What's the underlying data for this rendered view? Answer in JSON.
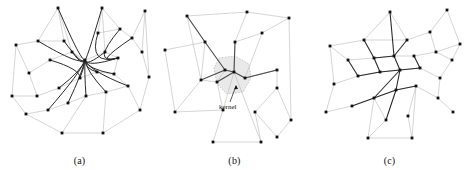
{
  "figure": {
    "background_color": "#ffffff",
    "panel_count": 3,
    "node_color": "#111111",
    "light_edge_color": "#b9b9b9",
    "dark_edge_color": "#2b2b2b",
    "kernel_fill_color": "#e9e9e9",
    "kernel_stroke_color": "#a8a8a8"
  },
  "panels": [
    {
      "id": "a",
      "caption": "(a)",
      "description": "bundled-curved-edge-drawing"
    },
    {
      "id": "b",
      "caption": "(b)",
      "description": "mesh-with-kernel-region",
      "annotation": {
        "label": "kernel",
        "arrow": true
      }
    },
    {
      "id": "c",
      "caption": "(c)",
      "description": "bundled-straight-edge-drawing"
    }
  ],
  "chart_data": {
    "type": "scatter",
    "title": "",
    "xlabel": "",
    "ylabel": "",
    "layout": "three side-by-side graph drawings",
    "panel_a": {
      "caption": "(a)",
      "nodes": [
        [
          14,
          45
        ],
        [
          56,
          8
        ],
        [
          100,
          8
        ],
        [
          143,
          11
        ],
        [
          36,
          41
        ],
        [
          62,
          41
        ],
        [
          96,
          33
        ],
        [
          118,
          29
        ],
        [
          130,
          38
        ],
        [
          27,
          73
        ],
        [
          48,
          60
        ],
        [
          70,
          52
        ],
        [
          83,
          60
        ],
        [
          103,
          52
        ],
        [
          116,
          58
        ],
        [
          10,
          96
        ],
        [
          35,
          96
        ],
        [
          57,
          88
        ],
        [
          78,
          78
        ],
        [
          95,
          72
        ],
        [
          112,
          74
        ],
        [
          24,
          114
        ],
        [
          46,
          110
        ],
        [
          66,
          103
        ],
        [
          84,
          96
        ],
        [
          104,
          92
        ],
        [
          126,
          86
        ],
        [
          60,
          133
        ],
        [
          101,
          133
        ],
        [
          138,
          110
        ],
        [
          147,
          77
        ],
        [
          140,
          52
        ]
      ],
      "light_edges": [
        [
          0,
          4
        ],
        [
          0,
          9
        ],
        [
          0,
          15
        ],
        [
          1,
          4
        ],
        [
          1,
          5
        ],
        [
          1,
          11
        ],
        [
          2,
          6
        ],
        [
          2,
          7
        ],
        [
          2,
          13
        ],
        [
          3,
          8
        ],
        [
          3,
          31
        ],
        [
          3,
          30
        ],
        [
          4,
          5
        ],
        [
          5,
          11
        ],
        [
          6,
          7
        ],
        [
          7,
          8
        ],
        [
          8,
          31
        ],
        [
          9,
          10
        ],
        [
          9,
          16
        ],
        [
          10,
          11
        ],
        [
          11,
          12
        ],
        [
          12,
          13
        ],
        [
          13,
          14
        ],
        [
          14,
          20
        ],
        [
          15,
          16
        ],
        [
          16,
          17
        ],
        [
          17,
          18
        ],
        [
          18,
          19
        ],
        [
          19,
          20
        ],
        [
          20,
          26
        ],
        [
          21,
          22
        ],
        [
          22,
          23
        ],
        [
          23,
          24
        ],
        [
          24,
          25
        ],
        [
          25,
          26
        ],
        [
          26,
          29
        ],
        [
          27,
          28
        ],
        [
          27,
          21
        ],
        [
          28,
          29
        ],
        [
          29,
          30
        ],
        [
          30,
          31
        ],
        [
          15,
          21
        ],
        [
          27,
          24
        ],
        [
          28,
          25
        ]
      ],
      "dark_edges_curved": [
        [
          1,
          12
        ],
        [
          2,
          12
        ],
        [
          4,
          12
        ],
        [
          5,
          12
        ],
        [
          11,
          12
        ],
        [
          10,
          18
        ],
        [
          18,
          12
        ],
        [
          19,
          12
        ],
        [
          13,
          12
        ],
        [
          20,
          12
        ],
        [
          24,
          12
        ],
        [
          23,
          12
        ],
        [
          17,
          12
        ],
        [
          22,
          12
        ],
        [
          25,
          12
        ],
        [
          26,
          12
        ],
        [
          6,
          14
        ],
        [
          7,
          14
        ],
        [
          8,
          14
        ],
        [
          14,
          12
        ]
      ]
    },
    "panel_b": {
      "caption": "(b)",
      "annotation_label": "kernel",
      "nodes": [
        [
          30,
          16
        ],
        [
          90,
          12
        ],
        [
          132,
          18
        ],
        [
          8,
          50
        ],
        [
          48,
          42
        ],
        [
          105,
          33
        ],
        [
          78,
          42
        ],
        [
          77,
          72
        ],
        [
          68,
          70
        ],
        [
          60,
          82
        ],
        [
          120,
          70
        ],
        [
          120,
          88
        ],
        [
          44,
          80
        ],
        [
          18,
          112
        ],
        [
          66,
          110
        ],
        [
          98,
          112
        ],
        [
          134,
          120
        ],
        [
          120,
          137
        ],
        [
          56,
          142
        ],
        [
          104,
          142
        ],
        [
          88,
          78
        ]
      ],
      "light_edges": [
        [
          0,
          1
        ],
        [
          1,
          2
        ],
        [
          0,
          4
        ],
        [
          1,
          6
        ],
        [
          2,
          5
        ],
        [
          5,
          6
        ],
        [
          3,
          4
        ],
        [
          3,
          13
        ],
        [
          4,
          12
        ],
        [
          12,
          13
        ],
        [
          13,
          14
        ],
        [
          14,
          18
        ],
        [
          18,
          19
        ],
        [
          19,
          15
        ],
        [
          15,
          17
        ],
        [
          17,
          16
        ],
        [
          16,
          11
        ],
        [
          11,
          10
        ],
        [
          10,
          20
        ],
        [
          9,
          14
        ],
        [
          8,
          9
        ],
        [
          12,
          9
        ],
        [
          6,
          7
        ],
        [
          7,
          20
        ],
        [
          20,
          10
        ],
        [
          7,
          8
        ],
        [
          0,
          12
        ],
        [
          2,
          16
        ],
        [
          5,
          20
        ],
        [
          15,
          11
        ],
        [
          14,
          7
        ],
        [
          19,
          7
        ]
      ],
      "dark_edges": [
        [
          4,
          8
        ],
        [
          12,
          8
        ],
        [
          8,
          7
        ],
        [
          7,
          20
        ],
        [
          20,
          10
        ],
        [
          7,
          9
        ],
        [
          6,
          7
        ],
        [
          0,
          4
        ]
      ],
      "kernel_region": [
        [
          62,
          58
        ],
        [
          78,
          56
        ],
        [
          92,
          64
        ],
        [
          94,
          78
        ],
        [
          86,
          92
        ],
        [
          70,
          94
        ],
        [
          60,
          84
        ],
        [
          57,
          68
        ]
      ]
    },
    "panel_c": {
      "caption": "(c)",
      "nodes": [
        [
          18,
          46
        ],
        [
          78,
          12
        ],
        [
          135,
          10
        ],
        [
          148,
          44
        ],
        [
          52,
          40
        ],
        [
          95,
          40
        ],
        [
          118,
          32
        ],
        [
          36,
          60
        ],
        [
          62,
          58
        ],
        [
          82,
          56
        ],
        [
          102,
          56
        ],
        [
          124,
          52
        ],
        [
          140,
          60
        ],
        [
          22,
          84
        ],
        [
          46,
          76
        ],
        [
          68,
          72
        ],
        [
          88,
          70
        ],
        [
          108,
          68
        ],
        [
          128,
          78
        ],
        [
          14,
          112
        ],
        [
          40,
          106
        ],
        [
          62,
          98
        ],
        [
          84,
          90
        ],
        [
          104,
          86
        ],
        [
          126,
          98
        ],
        [
          141,
          112
        ],
        [
          56,
          138
        ],
        [
          100,
          138
        ],
        [
          74,
          120
        ],
        [
          96,
          116
        ]
      ],
      "light_edges": [
        [
          0,
          4
        ],
        [
          0,
          7
        ],
        [
          0,
          13
        ],
        [
          1,
          4
        ],
        [
          1,
          5
        ],
        [
          2,
          6
        ],
        [
          2,
          3
        ],
        [
          3,
          12
        ],
        [
          3,
          11
        ],
        [
          4,
          5
        ],
        [
          5,
          6
        ],
        [
          6,
          11
        ],
        [
          7,
          8
        ],
        [
          8,
          9
        ],
        [
          9,
          10
        ],
        [
          10,
          11
        ],
        [
          11,
          12
        ],
        [
          13,
          14
        ],
        [
          14,
          15
        ],
        [
          15,
          16
        ],
        [
          16,
          17
        ],
        [
          17,
          18
        ],
        [
          18,
          24
        ],
        [
          18,
          12
        ],
        [
          19,
          20
        ],
        [
          20,
          21
        ],
        [
          21,
          22
        ],
        [
          22,
          23
        ],
        [
          23,
          24
        ],
        [
          24,
          25
        ],
        [
          26,
          27
        ],
        [
          26,
          21
        ],
        [
          27,
          23
        ],
        [
          13,
          19
        ],
        [
          28,
          21
        ],
        [
          29,
          23
        ],
        [
          26,
          28
        ],
        [
          27,
          29
        ]
      ],
      "dark_edges": [
        [
          4,
          8
        ],
        [
          8,
          9
        ],
        [
          9,
          16
        ],
        [
          14,
          15
        ],
        [
          15,
          16
        ],
        [
          16,
          22
        ],
        [
          16,
          17
        ],
        [
          17,
          10
        ],
        [
          7,
          14
        ],
        [
          21,
          22
        ],
        [
          22,
          23
        ],
        [
          9,
          5
        ],
        [
          8,
          15
        ],
        [
          20,
          21
        ],
        [
          22,
          28
        ],
        [
          16,
          21
        ],
        [
          1,
          9
        ]
      ]
    }
  }
}
